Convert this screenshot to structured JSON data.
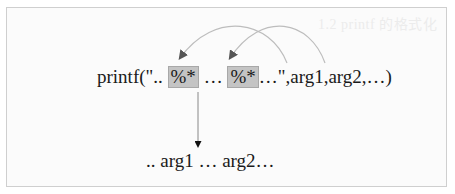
{
  "diagram": {
    "ghost_text": "1.2  printf 的格式化",
    "code": {
      "prefix": "printf(\"..",
      "spec1": "%*",
      "middle": "…",
      "spec2": "%*",
      "suffix": "…\",arg1,arg2,…)"
    },
    "result": ".. arg1 … arg2…",
    "colors": {
      "highlight_fill": "#c4c4c4",
      "arc_stroke": "#bdbdbd",
      "arrow_head": "#555555",
      "text": "#1a1a1a",
      "frame_border": "#cfcfcf"
    },
    "connections": [
      {
        "from": "arg1",
        "to": "spec1"
      },
      {
        "from": "arg2",
        "to": "spec2"
      },
      {
        "from": "format-string",
        "to": "result"
      }
    ]
  }
}
